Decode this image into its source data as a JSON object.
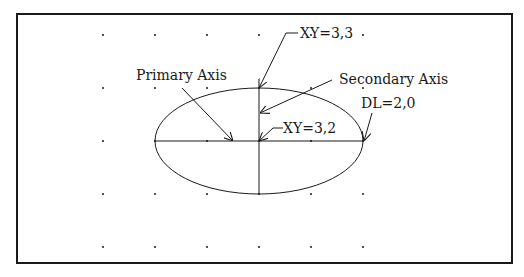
{
  "diagram": {
    "colors": {
      "stroke": "#1a1a1a",
      "background": "#ffffff"
    },
    "frame": {
      "x": 17,
      "y": 14,
      "width": 495,
      "height": 249
    },
    "grid": {
      "xs": [
        103,
        155,
        207,
        259,
        311,
        363
      ],
      "ys": [
        35,
        88,
        141,
        194,
        247
      ]
    },
    "ellipse": {
      "cx": 259,
      "cy": 141,
      "rx": 104,
      "ry": 53
    },
    "labels": {
      "xy_top": "XY=3,3",
      "secondary_axis": "Secondary Axis",
      "primary_axis": "Primary Axis",
      "dl": "DL=2,0",
      "xy_center": "XY=3,2"
    }
  }
}
